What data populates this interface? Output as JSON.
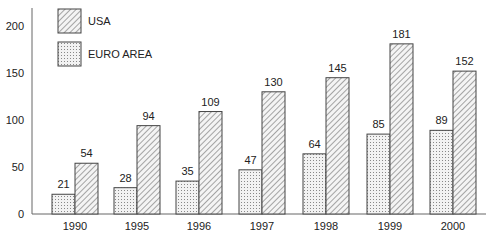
{
  "chart_data": {
    "type": "bar",
    "title": "",
    "xlabel": "",
    "ylabel": "",
    "categories": [
      "1990",
      "1995",
      "1996",
      "1997",
      "1998",
      "1999",
      "2000"
    ],
    "series": [
      {
        "name": "EURO AREA",
        "pattern": "dots",
        "values": [
          21,
          28,
          35,
          47,
          64,
          85,
          89
        ]
      },
      {
        "name": "USA",
        "pattern": "diagonal-hatch",
        "values": [
          54,
          94,
          109,
          130,
          145,
          181,
          152
        ]
      }
    ],
    "yticks": [
      0,
      50,
      100,
      150,
      200
    ],
    "ylim": [
      0,
      210
    ],
    "grid": false,
    "legend": {
      "position": "top-left",
      "entries": [
        "USA",
        "EURO AREA"
      ]
    },
    "data_labels": true
  }
}
